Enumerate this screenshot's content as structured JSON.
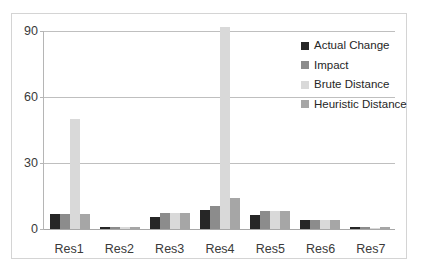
{
  "chart_data": {
    "type": "bar",
    "title": "",
    "xlabel": "",
    "ylabel": "",
    "categories": [
      "Res1",
      "Res2",
      "Res3",
      "Res4",
      "Res5",
      "Res6",
      "Res7"
    ],
    "yticks": [
      0,
      30,
      60,
      90
    ],
    "ylim": [
      0,
      90
    ],
    "grid": true,
    "legend_position": "top-right",
    "series": [
      {
        "name": "Actual Change",
        "color": "#262626",
        "values": [
          7,
          1,
          5.5,
          8.6,
          6.3,
          4,
          1
        ]
      },
      {
        "name": "Impact",
        "color": "#8c8c8c",
        "values": [
          7,
          0.8,
          7.5,
          10.5,
          8,
          4,
          0.8
        ]
      },
      {
        "name": "Brute Distance",
        "color": "#d9d9d9",
        "values": [
          50,
          0.8,
          7.5,
          92,
          8,
          4,
          0.6
        ]
      },
      {
        "name": "Heuristic Distance",
        "color": "#a6a6a6",
        "values": [
          7,
          1,
          7.5,
          14,
          8,
          4,
          0.8
        ]
      }
    ]
  },
  "axis": {
    "tick_0": "0",
    "tick_30": "30",
    "tick_60": "60",
    "tick_90": "90"
  },
  "colors": {
    "gridline": "#bfbfbf",
    "axis_line": "#b5b5b5",
    "frame_border": "#d4d4d4",
    "text": "#3a3a3a",
    "background": "#ffffff"
  }
}
